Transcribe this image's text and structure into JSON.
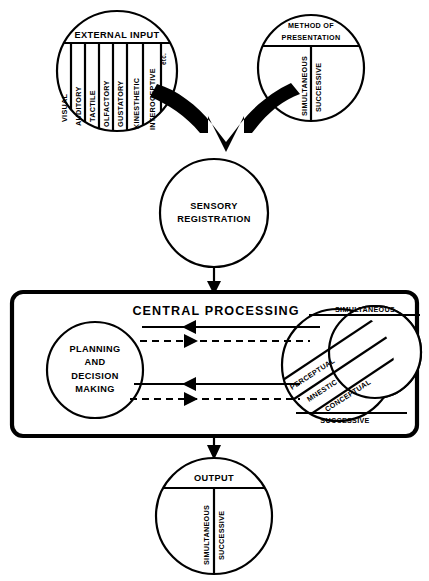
{
  "diagram": {
    "external_input": {
      "label": "EXTERNAL  INPUT",
      "channels": [
        "VISUAL",
        "AUDITORY",
        "TACTILE",
        "OLFACTORY",
        "GUSTATORY",
        "KINESTHETIC",
        "INTEROCEPTIVE"
      ],
      "etc_label": "etc."
    },
    "method_of_presentation": {
      "label_line1": "METHOD OF",
      "label_line2": "PRESENTATION",
      "modes": [
        "SIMULTANEOUS",
        "SUCCESSIVE"
      ]
    },
    "sensory_registration": {
      "label_line1": "SENSORY",
      "label_line2": "REGISTRATION"
    },
    "central_processing": {
      "title": "CENTRAL  PROCESSING",
      "planning": {
        "line1": "PLANNING",
        "line2": "AND",
        "line3": "DECISION",
        "line4": "MAKING"
      },
      "coding": {
        "top_band": "SIMULTANEOUS",
        "bottom_band": "SUCCESSIVE",
        "diagonal_bands": [
          "PERCEPTUAL",
          "MNESTIC",
          "CONCEPTUAL"
        ]
      }
    },
    "output": {
      "label": "OUTPUT",
      "modes": [
        "SIMULTANEOUS",
        "SUCCESSIVE"
      ]
    },
    "colors": {
      "ink": "#000000",
      "paper": "#ffffff"
    }
  }
}
